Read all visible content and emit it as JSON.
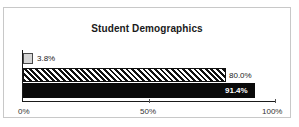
{
  "chart_data": {
    "type": "bar",
    "orientation": "horizontal",
    "title": "Student Demographics",
    "xlabel": "",
    "ylabel": "",
    "categories": [
      "Series 1",
      "Series 2",
      "Series 3"
    ],
    "values": [
      3.8,
      80.0,
      91.4
    ],
    "data_labels": [
      "3.8%",
      "80.0%",
      "91.4%"
    ],
    "xlim": [
      0,
      100
    ],
    "xticks": [
      0,
      50,
      100
    ],
    "xtick_labels": [
      "0%",
      "50%",
      "100%"
    ],
    "grid": false,
    "legend": "none",
    "bar_styles": [
      {
        "name": "Series 1",
        "fill": "#d6d6d6",
        "pattern": "solid",
        "border": "#4a4a4a"
      },
      {
        "name": "Series 2",
        "fill": "#ffffff",
        "pattern": "diagonal-hatch",
        "border": "#111111"
      },
      {
        "name": "Series 3",
        "fill": "#0a0a0a",
        "pattern": "solid",
        "border": "#0a0a0a"
      }
    ]
  },
  "colors": {
    "frame_border": "#c8c8c8",
    "axis": "#1a1a1a",
    "background": "#ffffff",
    "text": "#1a1a1a"
  }
}
